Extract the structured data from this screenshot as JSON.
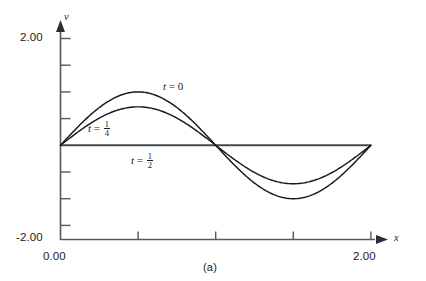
{
  "figure": {
    "caption": "(a)",
    "axes": {
      "x_name": "x",
      "y_name": "v",
      "x_ticks": [
        "0.00",
        "2.00"
      ],
      "y_ticks": [
        "2.00",
        "-2.00"
      ]
    },
    "curve_labels": [
      {
        "lead": "t",
        "eq": "=",
        "value": "0",
        "fraction": null
      },
      {
        "lead": "t",
        "eq": "=",
        "value": null,
        "fraction": {
          "num": "1",
          "den": "4"
        }
      },
      {
        "lead": "t",
        "eq": "=",
        "value": null,
        "fraction": {
          "num": "1",
          "den": "2"
        }
      }
    ],
    "colors": {
      "curve": "#17181a",
      "axis": "#55585c",
      "background": "#ffffff"
    }
  },
  "chart_data": {
    "type": "line",
    "title": "",
    "subtitle": "",
    "xlabel": "x",
    "ylabel": "v",
    "xlim": [
      0.0,
      2.0
    ],
    "ylim": [
      -2.0,
      2.0
    ],
    "xticks": [
      0.0,
      0.5,
      1.0,
      1.5,
      2.0
    ],
    "xticklabels": [
      "0.00",
      "",
      "",
      "",
      "2.00"
    ],
    "yticks": [
      -2.0,
      -1.5,
      -1.0,
      -0.5,
      0.0,
      0.5,
      1.0,
      1.5,
      2.0
    ],
    "yticklabels": [
      "-2.00",
      "",
      "",
      "",
      "",
      "",
      "",
      "",
      "2.00"
    ],
    "grid": false,
    "legend": "inline-annotations",
    "annotations": [
      {
        "text": "t = 0",
        "x": 0.82,
        "y": 1.28
      },
      {
        "text": "t = 1/4",
        "x": 0.3,
        "y": 0.38
      },
      {
        "text": "t = 1/2",
        "x": 0.62,
        "y": -0.28
      }
    ],
    "series": [
      {
        "name": "t = 0",
        "amplitude": 1.0,
        "formula": "v = 1.00 * sin(pi * x)",
        "x": [
          0.0,
          0.1,
          0.2,
          0.3,
          0.4,
          0.5,
          0.6,
          0.7,
          0.8,
          0.9,
          1.0,
          1.1,
          1.2,
          1.3,
          1.4,
          1.5,
          1.6,
          1.7,
          1.8,
          1.9,
          2.0
        ],
        "values": [
          0.0,
          0.309,
          0.588,
          0.809,
          0.951,
          1.0,
          0.951,
          0.809,
          0.588,
          0.309,
          0.0,
          -0.309,
          -0.588,
          -0.809,
          -0.951,
          -1.0,
          -0.951,
          -0.809,
          -0.588,
          -0.309,
          0.0
        ]
      },
      {
        "name": "t = 1/4",
        "amplitude": 0.72,
        "formula": "v = 0.72 * sin(pi * x)",
        "x": [
          0.0,
          0.1,
          0.2,
          0.3,
          0.4,
          0.5,
          0.6,
          0.7,
          0.8,
          0.9,
          1.0,
          1.1,
          1.2,
          1.3,
          1.4,
          1.5,
          1.6,
          1.7,
          1.8,
          1.9,
          2.0
        ],
        "values": [
          0.0,
          0.222,
          0.423,
          0.582,
          0.685,
          0.72,
          0.685,
          0.582,
          0.423,
          0.222,
          0.0,
          -0.222,
          -0.423,
          -0.582,
          -0.685,
          -0.72,
          -0.685,
          -0.582,
          -0.423,
          -0.222,
          0.0
        ]
      },
      {
        "name": "t = 1/2",
        "amplitude": 0.0,
        "formula": "v = 0",
        "x": [
          0.0,
          2.0
        ],
        "values": [
          0.0,
          0.0
        ]
      }
    ]
  }
}
